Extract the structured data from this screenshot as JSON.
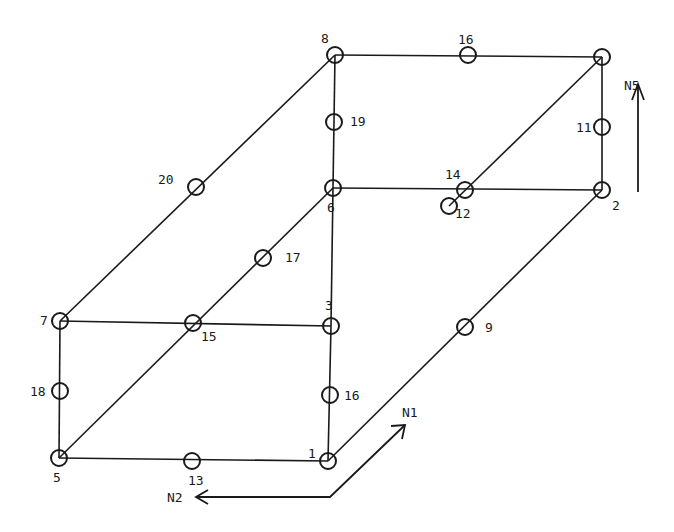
{
  "colors": {
    "ink": "#1a1a1a",
    "background": "#ffffff"
  },
  "nodes": [
    {
      "id": "1",
      "label": "1"
    },
    {
      "id": "2",
      "label": "2"
    },
    {
      "id": "3",
      "label": "3"
    },
    {
      "id": "4",
      "label": ""
    },
    {
      "id": "5",
      "label": "5"
    },
    {
      "id": "6",
      "label": "6"
    },
    {
      "id": "7",
      "label": "7"
    },
    {
      "id": "8",
      "label": "8"
    },
    {
      "id": "9",
      "label": "9"
    },
    {
      "id": "11",
      "label": "11"
    },
    {
      "id": "12",
      "label": "12"
    },
    {
      "id": "13",
      "label": "13"
    },
    {
      "id": "14",
      "label": "14"
    },
    {
      "id": "15",
      "label": "15"
    },
    {
      "id": "16a",
      "label": "16"
    },
    {
      "id": "16b",
      "label": "16"
    },
    {
      "id": "17",
      "label": "17"
    },
    {
      "id": "18",
      "label": "18"
    },
    {
      "id": "19",
      "label": "19"
    },
    {
      "id": "20",
      "label": "20"
    }
  ],
  "edges": [
    [
      "8",
      "4"
    ],
    [
      "8",
      "6"
    ],
    [
      "4",
      "2"
    ],
    [
      "6",
      "2"
    ],
    [
      "7",
      "3"
    ],
    [
      "7",
      "5"
    ],
    [
      "3",
      "1"
    ],
    [
      "5",
      "1"
    ],
    [
      "7",
      "8"
    ],
    [
      "3",
      "6"
    ],
    [
      "1",
      "2"
    ],
    [
      "5",
      "6"
    ],
    [
      "12",
      "4"
    ]
  ],
  "directions": [
    {
      "id": "N1",
      "label": "N1"
    },
    {
      "id": "N2",
      "label": "N2"
    },
    {
      "id": "N5",
      "label": "N5"
    }
  ]
}
